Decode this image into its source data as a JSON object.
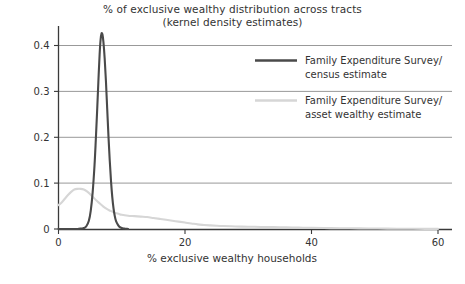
{
  "chart_data": {
    "type": "line",
    "title": "% of exclusive wealthy distribution across tracts",
    "subtitle": "(kernel density estimates)",
    "xlabel": "% exclusive wealthy households",
    "ylabel": "",
    "xlim": [
      0,
      60
    ],
    "ylim": [
      0,
      0.45
    ],
    "xticks": [
      0,
      20,
      40,
      60
    ],
    "xtick_labels": [
      "0",
      "20",
      "40",
      "60"
    ],
    "yticks": [
      0,
      0.1,
      0.2,
      0.3,
      0.4
    ],
    "ytick_labels": [
      "0",
      "0.1",
      "0.2",
      "0.3",
      "0.4"
    ],
    "grid": "horizontal",
    "legend_position": "top-right",
    "series": [
      {
        "name": "Family Expenditure Survey/ census estimate",
        "name_line1": "Family Expenditure Survey/",
        "name_line2": "census estimate",
        "color": "#4a4a4a",
        "width": 2.1,
        "points": [
          [
            0.0,
            0.0
          ],
          [
            1.0,
            0.0
          ],
          [
            2.0,
            0.0
          ],
          [
            3.0,
            0.0
          ],
          [
            3.6,
            0.001
          ],
          [
            4.0,
            0.002
          ],
          [
            4.4,
            0.006
          ],
          [
            4.8,
            0.018
          ],
          [
            5.1,
            0.04
          ],
          [
            5.4,
            0.08
          ],
          [
            5.7,
            0.14
          ],
          [
            5.9,
            0.195
          ],
          [
            6.1,
            0.255
          ],
          [
            6.3,
            0.32
          ],
          [
            6.5,
            0.38
          ],
          [
            6.65,
            0.412
          ],
          [
            6.8,
            0.426
          ],
          [
            6.95,
            0.424
          ],
          [
            7.1,
            0.408
          ],
          [
            7.3,
            0.372
          ],
          [
            7.5,
            0.322
          ],
          [
            7.7,
            0.262
          ],
          [
            7.9,
            0.202
          ],
          [
            8.1,
            0.15
          ],
          [
            8.3,
            0.105
          ],
          [
            8.5,
            0.07
          ],
          [
            8.7,
            0.045
          ],
          [
            8.9,
            0.028
          ],
          [
            9.1,
            0.017
          ],
          [
            9.4,
            0.009
          ],
          [
            9.7,
            0.004
          ],
          [
            10.0,
            0.002
          ],
          [
            10.4,
            0.001
          ],
          [
            11.0,
            0.0
          ]
        ]
      },
      {
        "name": "Family Expenditure Survey/ asset wealthy estimate",
        "name_line1": "Family Expenditure Survey/",
        "name_line2": "asset wealthy estimate",
        "color": "#d6d6d6",
        "width": 2.1,
        "points": [
          [
            0.0,
            0.052
          ],
          [
            0.5,
            0.058
          ],
          [
            1.0,
            0.066
          ],
          [
            1.5,
            0.074
          ],
          [
            2.0,
            0.081
          ],
          [
            2.5,
            0.086
          ],
          [
            3.0,
            0.0875
          ],
          [
            3.5,
            0.0875
          ],
          [
            4.0,
            0.086
          ],
          [
            4.5,
            0.082
          ],
          [
            5.0,
            0.076
          ],
          [
            5.5,
            0.069
          ],
          [
            6.0,
            0.062
          ],
          [
            6.5,
            0.056
          ],
          [
            7.0,
            0.05
          ],
          [
            7.5,
            0.045
          ],
          [
            8.0,
            0.041
          ],
          [
            8.5,
            0.038
          ],
          [
            9.0,
            0.035
          ],
          [
            9.5,
            0.033
          ],
          [
            10.0,
            0.031
          ],
          [
            11.0,
            0.029
          ],
          [
            12.0,
            0.028
          ],
          [
            13.0,
            0.027
          ],
          [
            14.0,
            0.026
          ],
          [
            15.0,
            0.024
          ],
          [
            16.0,
            0.022
          ],
          [
            17.0,
            0.02
          ],
          [
            18.0,
            0.018
          ],
          [
            19.0,
            0.016
          ],
          [
            20.0,
            0.014
          ],
          [
            21.0,
            0.012
          ],
          [
            22.0,
            0.01
          ],
          [
            23.0,
            0.0088
          ],
          [
            24.0,
            0.0078
          ],
          [
            25.0,
            0.007
          ],
          [
            26.0,
            0.0064
          ],
          [
            28.0,
            0.0056
          ],
          [
            30.0,
            0.005
          ],
          [
            32.0,
            0.0045
          ],
          [
            34.0,
            0.004
          ],
          [
            36.0,
            0.0035
          ],
          [
            38.0,
            0.003
          ],
          [
            40.0,
            0.0026
          ],
          [
            43.0,
            0.002
          ],
          [
            46.0,
            0.0015
          ],
          [
            49.0,
            0.0011
          ],
          [
            52.0,
            0.0008
          ],
          [
            55.0,
            0.0005
          ],
          [
            58.0,
            0.0003
          ],
          [
            60.0,
            0.0002
          ]
        ]
      }
    ]
  }
}
